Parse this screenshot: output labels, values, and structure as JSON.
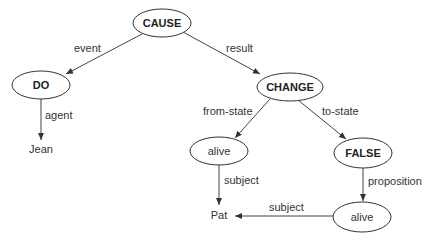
{
  "diagram": {
    "type": "conceptual-dependency-graph",
    "nodes": [
      {
        "id": "cause",
        "label": "CAUSE",
        "bold": true,
        "shape": "ellipse"
      },
      {
        "id": "do",
        "label": "DO",
        "bold": true,
        "shape": "ellipse"
      },
      {
        "id": "change",
        "label": "CHANGE",
        "bold": true,
        "shape": "ellipse"
      },
      {
        "id": "alive1",
        "label": "alive",
        "bold": false,
        "shape": "ellipse"
      },
      {
        "id": "false",
        "label": "FALSE",
        "bold": true,
        "shape": "ellipse"
      },
      {
        "id": "alive2",
        "label": "alive",
        "bold": false,
        "shape": "ellipse"
      },
      {
        "id": "jean",
        "label": "Jean",
        "bold": false,
        "shape": "text"
      },
      {
        "id": "pat",
        "label": "Pat",
        "bold": false,
        "shape": "text"
      }
    ],
    "edges": [
      {
        "from": "cause",
        "to": "do",
        "label": "event"
      },
      {
        "from": "cause",
        "to": "change",
        "label": "result"
      },
      {
        "from": "do",
        "to": "jean",
        "label": "agent"
      },
      {
        "from": "change",
        "to": "alive1",
        "label": "from-state"
      },
      {
        "from": "change",
        "to": "false",
        "label": "to-state"
      },
      {
        "from": "alive1",
        "to": "pat",
        "label": "subject"
      },
      {
        "from": "false",
        "to": "alive2",
        "label": "proposition"
      },
      {
        "from": "alive2",
        "to": "pat",
        "label": "subject"
      }
    ]
  },
  "labels": {
    "cause": "CAUSE",
    "do": "DO",
    "change": "CHANGE",
    "alive1": "alive",
    "false": "FALSE",
    "alive2": "alive",
    "jean": "Jean",
    "pat": "Pat",
    "edge_event": "event",
    "edge_result": "result",
    "edge_agent": "agent",
    "edge_from_state": "from-state",
    "edge_to_state": "to-state",
    "edge_subject1": "subject",
    "edge_proposition": "proposition",
    "edge_subject2": "subject"
  }
}
